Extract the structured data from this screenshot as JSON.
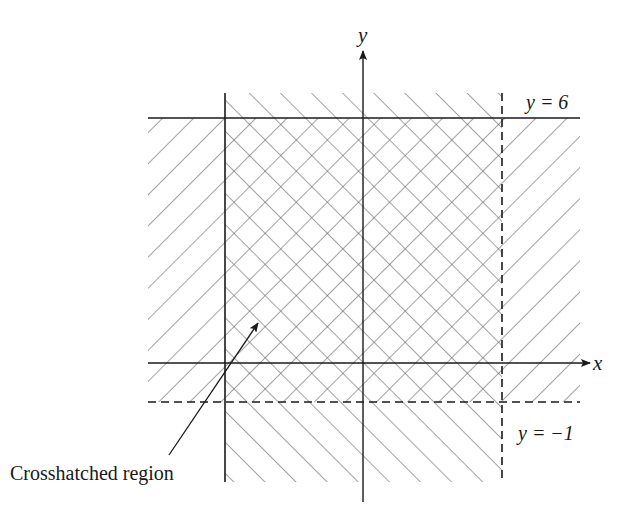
{
  "figure": {
    "type": "region-diagram",
    "colors": {
      "line": "#1a1a1a",
      "hatch": "#555555",
      "background": "#ffffff"
    },
    "axes": {
      "x_label": "x",
      "y_label": "y",
      "origin_px": [
        363,
        363
      ]
    },
    "boundaries": [
      {
        "id": "y6",
        "label": "y = 6",
        "orientation": "horizontal",
        "style": "solid",
        "pixel": 118
      },
      {
        "id": "yneg1",
        "label": "y = −1",
        "orientation": "horizontal",
        "style": "dashed",
        "pixel": 402
      },
      {
        "id": "left",
        "label": "",
        "orientation": "vertical",
        "style": "solid",
        "pixel": 225
      },
      {
        "id": "right",
        "label": "",
        "orientation": "vertical",
        "style": "dashed",
        "pixel": 502
      }
    ],
    "regions": [
      {
        "name": "horizontal-band",
        "hatch": "forward-slash",
        "bounds": "-1 < y ≤ 6"
      },
      {
        "name": "vertical-band",
        "hatch": "back-slash",
        "bounds": "left ≤ x < right"
      },
      {
        "name": "intersection",
        "hatch": "crosshatch"
      }
    ],
    "annotation": {
      "text": "Crosshatched region",
      "arrow_from": [
        169,
        455
      ],
      "arrow_to": [
        259,
        322
      ]
    }
  },
  "labels": {
    "x_axis": "x",
    "y_axis": "y",
    "line_y6": "y = 6",
    "line_yneg1": "y = −1",
    "crosshatch_note": "Crosshatched region"
  }
}
